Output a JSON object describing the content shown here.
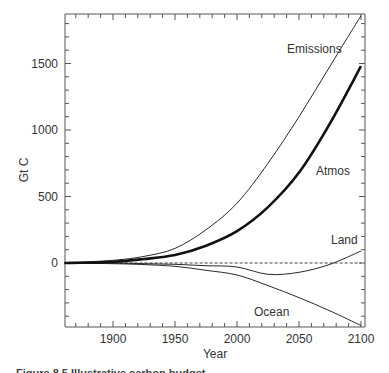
{
  "chart_data": {
    "type": "line",
    "title": "",
    "xlabel": "Year",
    "ylabel": "Gt C",
    "xlim": [
      1861,
      2100
    ],
    "ylim": [
      -480,
      1880
    ],
    "grid": false,
    "legend": "inline labels",
    "x_ticks": [
      1900,
      1950,
      2000,
      2050,
      2100
    ],
    "y_ticks": [
      0,
      500,
      1000,
      1500
    ],
    "x_tick_labels": [
      "1900",
      "1950",
      "2000",
      "2050",
      "2100"
    ],
    "y_tick_labels": [
      "0",
      "500",
      "1000",
      "1500"
    ],
    "x": [
      1861,
      1900,
      1925,
      1950,
      1975,
      2000,
      2025,
      2050,
      2075,
      2100
    ],
    "series": [
      {
        "name": "Emissions",
        "style": "thin solid",
        "values": [
          0,
          20,
          50,
          110,
          250,
          450,
          750,
          1100,
          1480,
          1860
        ]
      },
      {
        "name": "Atmos",
        "style": "thick solid",
        "values": [
          0,
          10,
          30,
          60,
          130,
          240,
          420,
          680,
          1050,
          1480
        ]
      },
      {
        "name": "Land",
        "style": "thin solid wiggly",
        "values": [
          0,
          0,
          -5,
          -10,
          -20,
          -30,
          -85,
          -70,
          -10,
          90
        ]
      },
      {
        "name": "Ocean",
        "style": "thin solid",
        "values": [
          0,
          -5,
          -12,
          -25,
          -55,
          -90,
          -170,
          -260,
          -360,
          -470
        ]
      },
      {
        "name": "Zero line",
        "style": "dashed",
        "values": [
          0,
          0,
          0,
          0,
          0,
          0,
          0,
          0,
          0,
          0
        ]
      }
    ],
    "annotations": [
      "Emissions",
      "Atmos",
      "Land",
      "Ocean"
    ]
  },
  "labels": {
    "emissions": "Emissions",
    "atmos": "Atmos",
    "land": "Land",
    "ocean": "Ocean",
    "xlabel": "Year",
    "ylabel": "Gt C",
    "y0": "0",
    "y500": "500",
    "y1000": "1000",
    "y1500": "1500",
    "x1900": "1900",
    "x1950": "1950",
    "x2000": "2000",
    "x2050": "2050",
    "x2100": "2100"
  },
  "caption": "Figure 8.5 Illustrative carbon budget..."
}
